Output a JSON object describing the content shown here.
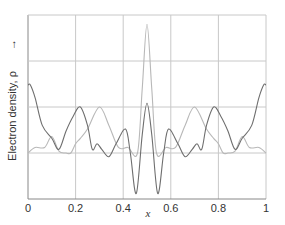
{
  "chart_data": {
    "type": "line",
    "title": "",
    "xlabel": "x",
    "ylabel": "Electron density, ρ",
    "ylabel_arrow": "→",
    "xlim": [
      0,
      1
    ],
    "x_ticks": [
      0,
      0.2,
      0.4,
      0.6,
      0.8,
      1
    ],
    "x_tick_labels": [
      "0",
      "0.2",
      "0.4",
      "0.6",
      "0.8",
      "1"
    ],
    "y_ticks_count": 5,
    "grid": true,
    "legend": null,
    "series": [
      {
        "name": "dark curve",
        "color": "#6e6e6e",
        "x": [
          0,
          0.01,
          0.03,
          0.06,
          0.1,
          0.13,
          0.16,
          0.19,
          0.22,
          0.25,
          0.27,
          0.29,
          0.31,
          0.34,
          0.37,
          0.41,
          0.43,
          0.455,
          0.48,
          0.5,
          0.52,
          0.545,
          0.57,
          0.59,
          0.63,
          0.66,
          0.69,
          0.71,
          0.73,
          0.75,
          0.78,
          0.81,
          0.84,
          0.87,
          0.9,
          0.94,
          0.97,
          0.99,
          1
        ],
        "y": [
          0.62,
          0.62,
          0.55,
          0.4,
          0.33,
          0.27,
          0.37,
          0.45,
          0.5,
          0.4,
          0.27,
          0.3,
          0.27,
          0.23,
          0.3,
          0.38,
          0.25,
          0.03,
          0.35,
          0.52,
          0.35,
          0.03,
          0.25,
          0.38,
          0.3,
          0.23,
          0.27,
          0.3,
          0.27,
          0.4,
          0.5,
          0.45,
          0.37,
          0.27,
          0.33,
          0.4,
          0.55,
          0.62,
          0.62
        ]
      },
      {
        "name": "light curve",
        "color": "#b8b8b8",
        "x": [
          0,
          0.03,
          0.07,
          0.1,
          0.13,
          0.16,
          0.18,
          0.2,
          0.22,
          0.25,
          0.3,
          0.34,
          0.38,
          0.42,
          0.46,
          0.48,
          0.5,
          0.52,
          0.54,
          0.58,
          0.62,
          0.66,
          0.7,
          0.75,
          0.78,
          0.8,
          0.82,
          0.84,
          0.87,
          0.9,
          0.93,
          0.97,
          1
        ],
        "y": [
          0.25,
          0.28,
          0.28,
          0.34,
          0.26,
          0.25,
          0.25,
          0.3,
          0.33,
          0.38,
          0.5,
          0.4,
          0.28,
          0.28,
          0.25,
          0.6,
          0.95,
          0.6,
          0.25,
          0.28,
          0.28,
          0.4,
          0.5,
          0.38,
          0.33,
          0.3,
          0.25,
          0.25,
          0.26,
          0.34,
          0.28,
          0.28,
          0.25
        ]
      }
    ]
  }
}
